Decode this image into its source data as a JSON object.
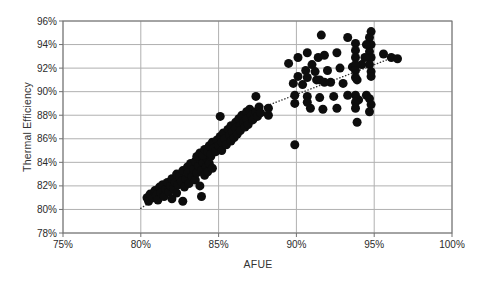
{
  "colors": {
    "background": "#ffffff",
    "gridline": "#b0b0b0",
    "axis": "#707070",
    "tick_text": "#2b2b2b",
    "axis_title": "#333333",
    "marker": "#0d0d0d",
    "trendline": "#333333"
  },
  "chart_data": {
    "type": "scatter",
    "title": "",
    "xlabel": "AFUE",
    "ylabel": "Thermal Efficiency",
    "xlim": [
      75,
      100
    ],
    "ylim": [
      78,
      96
    ],
    "grid": true,
    "legend": "none",
    "x_tick_values": [
      75,
      80,
      85,
      90,
      95,
      100
    ],
    "x_tick_labels": [
      "75%",
      "80%",
      "85%",
      "90%",
      "95%",
      "100%"
    ],
    "y_tick_values": [
      78,
      80,
      82,
      84,
      86,
      88,
      90,
      92,
      94,
      96
    ],
    "y_tick_labels": [
      "78%",
      "80%",
      "82%",
      "84%",
      "86%",
      "88%",
      "90%",
      "92%",
      "94%",
      "96%"
    ],
    "marker_radius": 4.5,
    "trendline": {
      "style": "dotted",
      "points": [
        [
          80.0,
          80.1
        ],
        [
          81.3,
          81.2
        ],
        [
          87.1,
          88.3
        ],
        [
          96.6,
          93.1
        ]
      ]
    },
    "points": [
      [
        80.4,
        81.0
      ],
      [
        80.5,
        80.7
      ],
      [
        80.6,
        81.3
      ],
      [
        80.8,
        81.0
      ],
      [
        80.9,
        81.6
      ],
      [
        81.0,
        81.2
      ],
      [
        81.1,
        80.8
      ],
      [
        81.2,
        81.9
      ],
      [
        81.3,
        81.4
      ],
      [
        81.4,
        82.1
      ],
      [
        81.5,
        81.1
      ],
      [
        81.6,
        81.7
      ],
      [
        81.7,
        82.3
      ],
      [
        81.8,
        81.5
      ],
      [
        81.9,
        82.0
      ],
      [
        82.0,
        80.9
      ],
      [
        82.0,
        82.6
      ],
      [
        82.1,
        81.8
      ],
      [
        82.2,
        82.3
      ],
      [
        82.3,
        81.4
      ],
      [
        82.3,
        83.0
      ],
      [
        82.4,
        82.1
      ],
      [
        82.5,
        82.8
      ],
      [
        82.6,
        82.4
      ],
      [
        82.7,
        80.7
      ],
      [
        82.7,
        83.3
      ],
      [
        82.8,
        81.9
      ],
      [
        82.9,
        82.6
      ],
      [
        83.0,
        83.6
      ],
      [
        83.0,
        83.1
      ],
      [
        83.1,
        82.2
      ],
      [
        83.2,
        83.9
      ],
      [
        83.3,
        82.8
      ],
      [
        83.4,
        83.4
      ],
      [
        83.5,
        84.1
      ],
      [
        83.5,
        82.5
      ],
      [
        83.6,
        83.1
      ],
      [
        83.7,
        83.7
      ],
      [
        83.8,
        84.3
      ],
      [
        83.8,
        82.0
      ],
      [
        83.9,
        81.1
      ],
      [
        83.9,
        83.3
      ],
      [
        84.0,
        84.0
      ],
      [
        84.1,
        82.9
      ],
      [
        84.2,
        83.6
      ],
      [
        84.2,
        84.4
      ],
      [
        84.3,
        83.2
      ],
      [
        84.4,
        83.9
      ],
      [
        84.5,
        84.5
      ],
      [
        84.6,
        83.5
      ],
      [
        83.6,
        84.5
      ],
      [
        83.8,
        84.8
      ],
      [
        84.0,
        84.6
      ],
      [
        84.1,
        85.1
      ],
      [
        84.3,
        84.9
      ],
      [
        84.4,
        85.4
      ],
      [
        84.5,
        84.7
      ],
      [
        84.6,
        85.7
      ],
      [
        84.7,
        85.2
      ],
      [
        84.8,
        84.9
      ],
      [
        84.9,
        85.9
      ],
      [
        85.0,
        85.4
      ],
      [
        85.1,
        86.2
      ],
      [
        85.1,
        87.9
      ],
      [
        85.2,
        85.7
      ],
      [
        85.2,
        85.0
      ],
      [
        85.3,
        86.5
      ],
      [
        85.4,
        86.0
      ],
      [
        85.5,
        85.5
      ],
      [
        85.6,
        86.8
      ],
      [
        85.7,
        86.3
      ],
      [
        85.8,
        85.8
      ],
      [
        85.8,
        87.1
      ],
      [
        85.9,
        86.6
      ],
      [
        86.0,
        86.1
      ],
      [
        86.1,
        87.4
      ],
      [
        86.1,
        86.9
      ],
      [
        86.2,
        86.4
      ],
      [
        86.3,
        87.7
      ],
      [
        86.4,
        87.1
      ],
      [
        86.4,
        86.7
      ],
      [
        86.5,
        88.0
      ],
      [
        86.6,
        87.4
      ],
      [
        86.7,
        87.0
      ],
      [
        86.8,
        88.3
      ],
      [
        86.8,
        87.7
      ],
      [
        86.9,
        87.2
      ],
      [
        87.0,
        88.5
      ],
      [
        87.1,
        88.0
      ],
      [
        87.2,
        87.6
      ],
      [
        87.4,
        89.6
      ],
      [
        87.4,
        88.3
      ],
      [
        87.5,
        87.9
      ],
      [
        87.6,
        88.7
      ],
      [
        87.7,
        88.2
      ],
      [
        88.2,
        88.6
      ],
      [
        88.2,
        88.0
      ],
      [
        89.9,
        85.5
      ],
      [
        93.9,
        87.4
      ],
      [
        89.5,
        92.4
      ],
      [
        90.1,
        92.9
      ],
      [
        90.7,
        93.3
      ],
      [
        91.4,
        92.9
      ],
      [
        91.0,
        92.3
      ],
      [
        91.8,
        93.1
      ],
      [
        92.6,
        93.3
      ],
      [
        93.3,
        94.6
      ],
      [
        91.6,
        94.8
      ],
      [
        90.6,
        91.8
      ],
      [
        91.2,
        91.7
      ],
      [
        92.0,
        91.8
      ],
      [
        92.8,
        92.0
      ],
      [
        93.6,
        92.1
      ],
      [
        94.2,
        92.3
      ],
      [
        89.8,
        90.7
      ],
      [
        90.4,
        90.6
      ],
      [
        91.5,
        91.0
      ],
      [
        92.2,
        90.8
      ],
      [
        93.0,
        90.7
      ],
      [
        93.9,
        91.0
      ],
      [
        89.9,
        89.7
      ],
      [
        90.7,
        89.6
      ],
      [
        91.5,
        89.5
      ],
      [
        92.4,
        89.6
      ],
      [
        93.3,
        89.7
      ],
      [
        94.0,
        89.3
      ],
      [
        94.5,
        89.7
      ],
      [
        90.9,
        88.6
      ],
      [
        91.7,
        88.5
      ],
      [
        92.6,
        88.6
      ],
      [
        89.9,
        89.0
      ],
      [
        90.7,
        89.1
      ],
      [
        90.1,
        91.3
      ],
      [
        90.7,
        91.2
      ],
      [
        91.3,
        91.0
      ],
      [
        91.8,
        90.8
      ],
      [
        93.8,
        94.1
      ],
      [
        93.8,
        93.5
      ],
      [
        93.8,
        92.9
      ],
      [
        93.8,
        92.3
      ],
      [
        93.8,
        91.8
      ],
      [
        93.8,
        91.2
      ],
      [
        93.8,
        89.7
      ],
      [
        93.8,
        89.1
      ],
      [
        93.8,
        88.6
      ],
      [
        94.8,
        95.1
      ],
      [
        94.7,
        94.6
      ],
      [
        94.8,
        94.0
      ],
      [
        94.7,
        93.4
      ],
      [
        94.8,
        92.9
      ],
      [
        94.7,
        92.3
      ],
      [
        94.8,
        91.7
      ],
      [
        94.8,
        91.3
      ],
      [
        94.7,
        89.4
      ],
      [
        94.8,
        88.9
      ],
      [
        94.7,
        88.3
      ],
      [
        94.5,
        94.0
      ],
      [
        94.4,
        92.9
      ],
      [
        95.6,
        93.2
      ],
      [
        96.1,
        92.9
      ],
      [
        96.5,
        92.8
      ]
    ]
  }
}
